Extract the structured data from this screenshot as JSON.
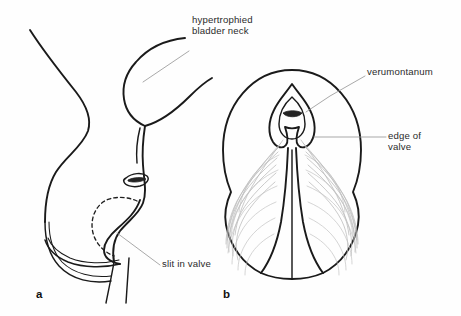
{
  "figure": {
    "width": 461,
    "height": 316,
    "background_color": "#fefefe",
    "ink_color": "#1a1a1a",
    "fan_color": "#b9b9b9",
    "leader_color": "#9a9a9a",
    "type": "medical-line-drawing"
  },
  "panels": [
    {
      "id": "a",
      "letter": "a",
      "view": "sagittal-section",
      "description": "lateral sagittal outline of bladder, bladder neck and posterior urethra with valve leaflet"
    },
    {
      "id": "b",
      "letter": "b",
      "view": "endoscopic-anterior",
      "description": "oval endoscopic view of verumontanum with fan-shaped valve leaflets"
    }
  ],
  "labels": [
    {
      "id": "hypertrophied-bladder-neck",
      "text": "hypertrophied\nbladder neck",
      "lines": [
        "hypertrophied",
        "bladder neck"
      ],
      "panel": "a"
    },
    {
      "id": "slit-in-valve",
      "text": "slit in valve",
      "lines": [
        "slit in valve"
      ],
      "panel": "a"
    },
    {
      "id": "verumontanum",
      "text": "verumontanum",
      "lines": [
        "verumontanum"
      ],
      "panel": "b"
    },
    {
      "id": "edge-of-valve",
      "text": "edge of\nvalve",
      "lines": [
        "edge of",
        "valve"
      ],
      "panel": "b"
    }
  ]
}
